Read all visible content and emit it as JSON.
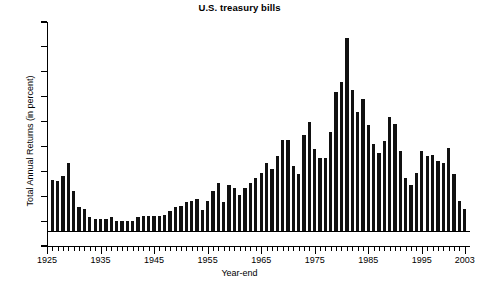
{
  "chart_data": {
    "type": "bar",
    "title": "U.S. treasury bills",
    "xlabel": "Year-end",
    "ylabel": "Total Annual Returns (in percent)",
    "ylim": [
      -2,
      16
    ],
    "ytick_labels": [
      "16",
      "14",
      "12",
      "10",
      "8",
      "6",
      "4",
      "2",
      "0",
      "-2"
    ],
    "ytick_values": [
      16,
      14,
      12,
      10,
      8,
      6,
      4,
      2,
      0,
      -2
    ],
    "xtick_labels": [
      "1925",
      "1935",
      "1945",
      "1955",
      "1965",
      "1975",
      "1985",
      "1995",
      "2003"
    ],
    "xtick_values": [
      1925,
      1935,
      1945,
      1955,
      1965,
      1975,
      1985,
      1995,
      2003
    ],
    "xlim": [
      1925,
      2004
    ],
    "grid": false,
    "legend": null,
    "bar_color": "#111111",
    "categories": [
      1926,
      1927,
      1928,
      1929,
      1930,
      1931,
      1932,
      1933,
      1934,
      1935,
      1936,
      1937,
      1938,
      1939,
      1940,
      1941,
      1942,
      1943,
      1944,
      1945,
      1946,
      1947,
      1948,
      1949,
      1950,
      1951,
      1952,
      1953,
      1954,
      1955,
      1956,
      1957,
      1958,
      1959,
      1960,
      1961,
      1962,
      1963,
      1964,
      1965,
      1966,
      1967,
      1968,
      1969,
      1970,
      1971,
      1972,
      1973,
      1974,
      1975,
      1976,
      1977,
      1978,
      1979,
      1980,
      1981,
      1982,
      1983,
      1984,
      1985,
      1986,
      1987,
      1988,
      1989,
      1990,
      1991,
      1992,
      1993,
      1994,
      1995,
      1996,
      1997,
      1998,
      1999,
      2000,
      2001,
      2002,
      2003
    ],
    "values": [
      3.3,
      3.2,
      3.6,
      4.7,
      2.4,
      1.1,
      1.0,
      0.3,
      0.2,
      0.2,
      0.2,
      0.3,
      0.0,
      0.0,
      0.0,
      0.0,
      0.3,
      0.4,
      0.4,
      0.4,
      0.4,
      0.5,
      0.8,
      1.1,
      1.2,
      1.5,
      1.6,
      1.8,
      0.9,
      1.6,
      2.4,
      3.1,
      1.5,
      2.9,
      2.7,
      2.1,
      2.7,
      3.1,
      3.5,
      3.9,
      4.7,
      4.2,
      5.2,
      6.5,
      6.5,
      4.4,
      3.8,
      6.9,
      8.0,
      5.8,
      5.1,
      5.1,
      7.2,
      10.4,
      11.2,
      14.7,
      10.5,
      8.8,
      9.8,
      7.7,
      6.2,
      5.5,
      6.4,
      8.4,
      7.8,
      5.6,
      3.5,
      2.9,
      3.9,
      5.6,
      5.2,
      5.3,
      4.8,
      4.7,
      5.9,
      3.8,
      1.6,
      1.0
    ]
  },
  "figure": {
    "background": "#ffffff",
    "axis_color": "#000000"
  }
}
